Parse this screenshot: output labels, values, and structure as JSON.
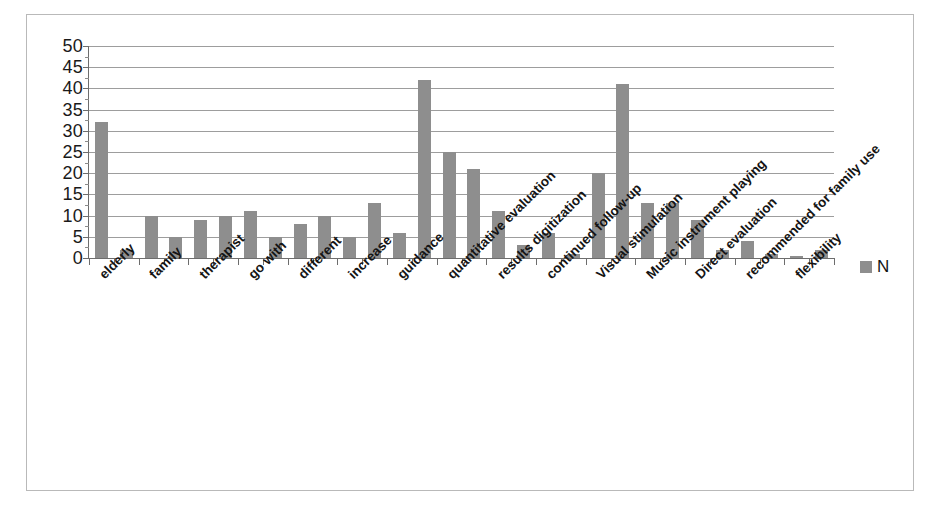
{
  "chart_data": {
    "type": "bar",
    "title": "",
    "subtitle": "",
    "xlabel": "",
    "ylabel": "",
    "ylim": [
      0,
      50
    ],
    "yticks": [
      0,
      5,
      10,
      15,
      20,
      25,
      30,
      35,
      40,
      45,
      50
    ],
    "ytick_labels": [
      "0",
      "5",
      "10",
      "15",
      "20",
      "25",
      "30",
      "35",
      "40",
      "45",
      "50"
    ],
    "grid": true,
    "legend_position": "right",
    "legend": [
      "N"
    ],
    "series": [
      {
        "name": "N",
        "color": "#8e8e8e",
        "values": [
          32,
          2,
          10,
          5,
          9,
          10,
          11,
          5,
          8,
          10,
          5,
          13,
          6,
          42,
          25,
          21,
          11,
          3,
          6,
          1,
          20,
          41,
          13,
          13,
          9,
          2,
          4,
          1,
          0.5,
          2
        ]
      }
    ],
    "categories": [
      "elderly",
      "",
      "family",
      "",
      "therapist",
      "",
      "go with",
      "",
      "different",
      "",
      "increase",
      "",
      "guidance",
      "",
      "quantitative evaluation",
      "",
      "results digitization",
      "",
      "continued follow-up",
      "",
      "Visual stimulation",
      "",
      "Music instrument playing",
      "",
      "Direct evaluation",
      "",
      "recommended for family use",
      "",
      "flexibility",
      ""
    ],
    "visible_tick_labels": [
      "elderly",
      "family",
      "therapist",
      "go with",
      "different",
      "increase",
      "guidance",
      "quantitative evaluation",
      "results digitization",
      "continued follow-up",
      "Visual stimulation",
      "Music instrument playing",
      "Direct evaluation",
      "recommended for family use",
      "flexibility"
    ]
  },
  "legend": {
    "series_label": "N",
    "swatch_color": "#8e8e8e"
  },
  "colors": {
    "bar": "#8e8e8e",
    "gridline": "#9d9d9d",
    "axis": "#6d6d6d",
    "frame": "#b9b9b9",
    "background": "#ffffff",
    "text": "#141414"
  }
}
